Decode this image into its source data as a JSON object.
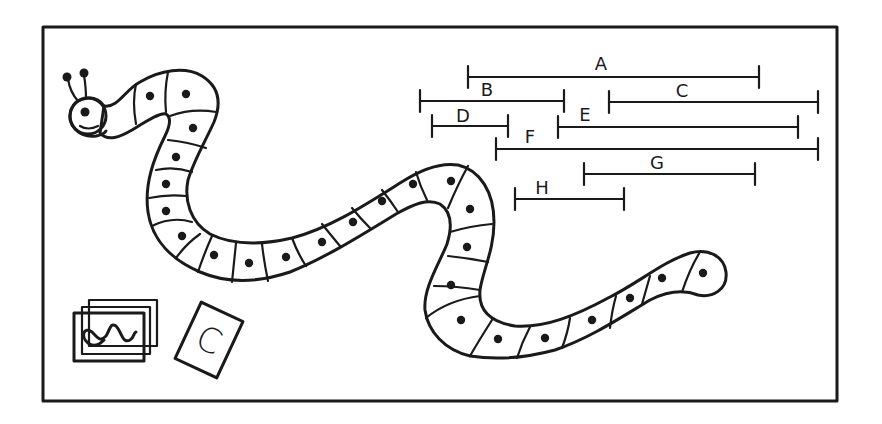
{
  "frame": {
    "x": 43,
    "y": 27,
    "w": 794,
    "h": 374,
    "stroke": "#1a1a1a",
    "background": "#ffffff"
  },
  "snake": {
    "description": "Board-game snake path with numbered-style spaces marked by dots",
    "space_count": 27,
    "dots": [
      [
        150,
        96
      ],
      [
        186,
        94
      ],
      [
        193,
        128
      ],
      [
        176,
        157
      ],
      [
        166,
        184
      ],
      [
        166,
        211
      ],
      [
        182,
        236
      ],
      [
        214,
        255
      ],
      [
        249,
        263
      ],
      [
        286,
        257
      ],
      [
        322,
        242
      ],
      [
        353,
        222
      ],
      [
        382,
        201
      ],
      [
        413,
        184
      ],
      [
        451,
        181
      ],
      [
        470,
        209
      ],
      [
        467,
        247
      ],
      [
        451,
        285
      ],
      [
        461,
        320
      ],
      [
        498,
        339
      ],
      [
        545,
        338
      ],
      [
        592,
        320
      ],
      [
        630,
        298
      ],
      [
        662,
        278
      ],
      [
        703,
        273
      ]
    ],
    "head": {
      "eye": [
        85,
        112
      ],
      "antenna_balls": [
        [
          67,
          77
        ],
        [
          84,
          73
        ]
      ]
    }
  },
  "segments": [
    {
      "label": "A",
      "x1": 468,
      "x2": 759,
      "y": 77,
      "label_x": 601,
      "label_y": 70
    },
    {
      "label": "B",
      "x1": 420,
      "x2": 564,
      "y": 101,
      "label_x": 487,
      "label_y": 96
    },
    {
      "label": "C",
      "x1": 609,
      "x2": 818,
      "y": 102,
      "label_x": 682,
      "label_y": 97
    },
    {
      "label": "D",
      "x1": 432,
      "x2": 508,
      "y": 126,
      "label_x": 463,
      "label_y": 122
    },
    {
      "label": "E",
      "x1": 558,
      "x2": 798,
      "y": 127,
      "label_x": 585,
      "label_y": 121
    },
    {
      "label": "F",
      "x1": 496,
      "x2": 818,
      "y": 149,
      "label_x": 530,
      "label_y": 143
    },
    {
      "label": "G",
      "x1": 584,
      "x2": 755,
      "y": 174,
      "label_x": 657,
      "label_y": 169
    },
    {
      "label": "H",
      "x1": 515,
      "x2": 624,
      "y": 199,
      "label_x": 542,
      "label_y": 194
    }
  ],
  "cards": {
    "stack": {
      "count": 3,
      "front_symbol": "wavy-line"
    },
    "single": {
      "letter": "C"
    }
  }
}
